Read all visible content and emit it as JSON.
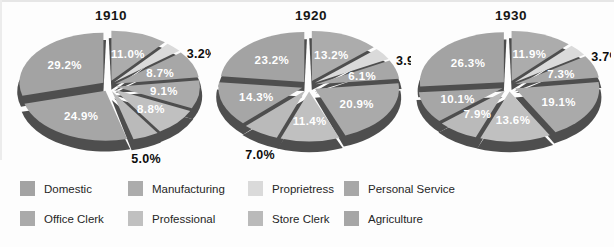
{
  "colors": {
    "background": "#fdfdfd",
    "slice_side": "#4e4e4e",
    "label_inside": "#ffffff",
    "label_outside": "#0d0d0d",
    "title_text": "#161616",
    "legend_text": "#262626"
  },
  "categories": [
    {
      "name": "Domestic",
      "color": "#a3a3a3"
    },
    {
      "name": "Manufacturing",
      "color": "#acacac"
    },
    {
      "name": "Proprietress",
      "color": "#dadada"
    },
    {
      "name": "Personal Service",
      "color": "#a7a7a7"
    },
    {
      "name": "Office Clerk",
      "color": "#aaaaaa"
    },
    {
      "name": "Professional",
      "color": "#c0c0c0"
    },
    {
      "name": "Store Clerk",
      "color": "#bababa"
    },
    {
      "name": "Agriculture",
      "color": "#a6a6a6"
    }
  ],
  "chart_data": [
    {
      "type": "pie",
      "title": "1910",
      "unit": "percent",
      "style": "3d-exploded",
      "start_angle_deg": 0,
      "direction": "clockwise",
      "slices": [
        {
          "category": "Manufacturing",
          "value": 11.0,
          "label": "11.0%",
          "label_outside": false
        },
        {
          "category": "Proprietress",
          "value": 3.2,
          "label": "3.2%",
          "label_outside": true
        },
        {
          "category": "Personal Service",
          "value": 8.7,
          "label": "8.7%",
          "label_outside": false
        },
        {
          "category": "Office Clerk",
          "value": 9.1,
          "label": "9.1%",
          "label_outside": false
        },
        {
          "category": "Professional",
          "value": 8.8,
          "label": "8.8%",
          "label_outside": false
        },
        {
          "category": "Store Clerk",
          "value": 5.0,
          "label": "5.0%",
          "label_outside": true
        },
        {
          "category": "Agriculture",
          "value": 24.9,
          "label": "24.9%",
          "label_outside": false
        },
        {
          "category": "Domestic",
          "value": 29.2,
          "label": "29.2%",
          "label_outside": false
        }
      ]
    },
    {
      "type": "pie",
      "title": "1920",
      "unit": "percent",
      "style": "3d-exploded",
      "start_angle_deg": 0,
      "direction": "clockwise",
      "slices": [
        {
          "category": "Manufacturing",
          "value": 13.2,
          "label": "13.2%",
          "label_outside": false
        },
        {
          "category": "Proprietress",
          "value": 3.9,
          "label": "3.9%",
          "label_outside": true
        },
        {
          "category": "Personal Service",
          "value": 6.1,
          "label": "6.1%",
          "label_outside": false
        },
        {
          "category": "Office Clerk",
          "value": 20.9,
          "label": "20.9%",
          "label_outside": false
        },
        {
          "category": "Professional",
          "value": 11.4,
          "label": "11.4%",
          "label_outside": false
        },
        {
          "category": "Store Clerk",
          "value": 7.0,
          "label": "7.0%",
          "label_outside": true
        },
        {
          "category": "Agriculture",
          "value": 14.3,
          "label": "14.3%",
          "label_outside": false
        },
        {
          "category": "Domestic",
          "value": 23.2,
          "label": "23.2%",
          "label_outside": false
        }
      ]
    },
    {
      "type": "pie",
      "title": "1930",
      "unit": "percent",
      "style": "3d-exploded",
      "start_angle_deg": 0,
      "direction": "clockwise",
      "slices": [
        {
          "category": "Manufacturing",
          "value": 11.9,
          "label": "11.9%",
          "label_outside": false
        },
        {
          "category": "Proprietress",
          "value": 3.7,
          "label": "3.7%",
          "label_outside": true
        },
        {
          "category": "Personal Service",
          "value": 7.3,
          "label": "7.3%",
          "label_outside": false
        },
        {
          "category": "Office Clerk",
          "value": 19.1,
          "label": "19.1%",
          "label_outside": false
        },
        {
          "category": "Professional",
          "value": 13.6,
          "label": "13.6%",
          "label_outside": false
        },
        {
          "category": "Store Clerk",
          "value": 7.9,
          "label": "7.9%",
          "label_outside": false
        },
        {
          "category": "Agriculture",
          "value": 10.1,
          "label": "10.1%",
          "label_outside": false
        },
        {
          "category": "Domestic",
          "value": 26.3,
          "label": "26.3%",
          "label_outside": false
        }
      ]
    }
  ],
  "legend": {
    "rows": 2,
    "columns": 4,
    "items": [
      {
        "label": "Domestic",
        "color": "#a3a3a3"
      },
      {
        "label": "Manufacturing",
        "color": "#acacac"
      },
      {
        "label": "Proprietress",
        "color": "#dadada"
      },
      {
        "label": "Personal Service",
        "color": "#a7a7a7"
      },
      {
        "label": "Office Clerk",
        "color": "#aaaaaa"
      },
      {
        "label": "Professional",
        "color": "#c0c0c0"
      },
      {
        "label": "Store Clerk",
        "color": "#bababa"
      },
      {
        "label": "Agriculture",
        "color": "#a6a6a6"
      }
    ]
  }
}
